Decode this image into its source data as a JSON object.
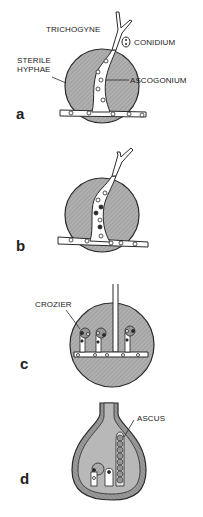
{
  "figure": {
    "panels": [
      {
        "letter": "a",
        "labels": {
          "trichogyne": "TRICHOGYNE",
          "conidium": "CONIDIUM",
          "sterile_hyphae": "STERILE\nHYPHAE",
          "ascogonium": "ASCOGONIUM"
        }
      },
      {
        "letter": "b",
        "labels": {}
      },
      {
        "letter": "c",
        "labels": {
          "crozier": "CROZIER"
        }
      },
      {
        "letter": "d",
        "labels": {
          "ascus": "ASCUS"
        }
      }
    ],
    "colors": {
      "fill": "#a8a8a8",
      "hatch": "#8f8f8f",
      "outline": "#2a2a2a",
      "background": "#ffffff"
    }
  }
}
